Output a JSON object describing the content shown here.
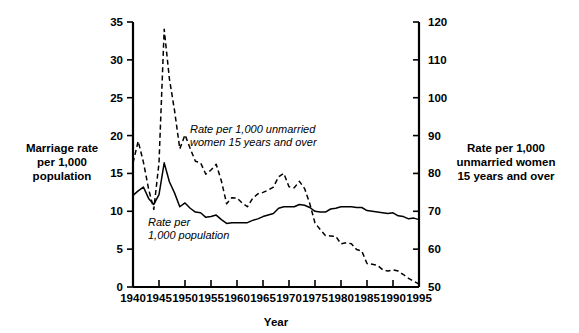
{
  "chart_data": {
    "type": "line",
    "title": "",
    "xlabel": "Year",
    "x": [
      1940,
      1941,
      1942,
      1943,
      1944,
      1945,
      1946,
      1947,
      1948,
      1949,
      1950,
      1951,
      1952,
      1953,
      1954,
      1955,
      1956,
      1957,
      1958,
      1959,
      1960,
      1961,
      1962,
      1963,
      1964,
      1965,
      1966,
      1967,
      1968,
      1969,
      1970,
      1971,
      1972,
      1973,
      1974,
      1975,
      1976,
      1977,
      1978,
      1979,
      1980,
      1981,
      1982,
      1983,
      1984,
      1985,
      1986,
      1987,
      1988,
      1989,
      1990,
      1991,
      1992,
      1993,
      1994,
      1995
    ],
    "xlim": [
      1940,
      1995
    ],
    "xticks": [
      1940,
      1945,
      1950,
      1955,
      1960,
      1965,
      1970,
      1975,
      1980,
      1985,
      1990,
      1995
    ],
    "xticklabels": [
      "1940",
      "1945",
      "1950",
      "1955",
      "1960",
      "1965",
      "1970",
      "1975",
      "1980",
      "1985",
      "1990",
      "1995"
    ],
    "grid": false,
    "legend_position": "inline-annotations",
    "axes": [
      {
        "id": "left",
        "side": "left",
        "label": "Marriage rate\nper 1,000\npopulation",
        "label_lines": [
          "Marriage rate",
          "per 1,000",
          "population"
        ],
        "ylim": [
          0,
          35
        ],
        "yticks": [
          0,
          5,
          10,
          15,
          20,
          25,
          30,
          35
        ],
        "yticklabels": [
          "0",
          "5",
          "10",
          "15",
          "20",
          "25",
          "30",
          "35"
        ]
      },
      {
        "id": "right",
        "side": "right",
        "label": "Rate per 1,000\nunmarried women\n15 years and over",
        "label_lines": [
          "Rate per 1,000",
          "unmarried women",
          "15 years and over"
        ],
        "ylim": [
          50,
          120
        ],
        "yticks": [
          50,
          60,
          70,
          80,
          90,
          100,
          110,
          120
        ],
        "yticklabels": [
          "50",
          "60",
          "70",
          "80",
          "90",
          "100",
          "110",
          "120"
        ]
      }
    ],
    "series": [
      {
        "name": "Rate per 1,000 population",
        "axis": "left",
        "style": "solid",
        "color": "#000000",
        "annotation": "Rate per\n1,000 population",
        "annotation_lines": [
          "Rate per",
          "1,000 population"
        ],
        "values": [
          12.1,
          12.7,
          13.2,
          11.7,
          10.9,
          12.2,
          16.4,
          13.9,
          12.4,
          10.6,
          11.1,
          10.4,
          9.9,
          9.8,
          9.2,
          9.3,
          9.5,
          8.9,
          8.4,
          8.5,
          8.5,
          8.5,
          8.5,
          8.8,
          9.0,
          9.3,
          9.5,
          9.7,
          10.4,
          10.6,
          10.6,
          10.6,
          10.9,
          10.8,
          10.5,
          10.0,
          9.9,
          9.9,
          10.3,
          10.4,
          10.6,
          10.6,
          10.6,
          10.5,
          10.5,
          10.1,
          10.0,
          9.9,
          9.8,
          9.7,
          9.8,
          9.4,
          9.3,
          9.0,
          9.1,
          8.9
        ]
      },
      {
        "name": "Rate per 1,000 unmarried women 15 years and over",
        "axis": "right",
        "style": "dashed",
        "color": "#000000",
        "annotation": "Rate per 1,000 unmarried\nwomen 15 years and over",
        "annotation_lines": [
          "Rate per 1,000 unmarried",
          "women 15 years and over"
        ],
        "values": [
          82.8,
          88.5,
          83.0,
          75.9,
          70.5,
          82.8,
          118.1,
          105.0,
          96.5,
          86.5,
          90.2,
          86.6,
          83.2,
          82.8,
          79.8,
          80.9,
          82.4,
          78.0,
          72.0,
          73.6,
          73.5,
          72.2,
          71.2,
          73.4,
          74.6,
          75.0,
          75.6,
          76.4,
          79.1,
          80.0,
          76.5,
          76.2,
          77.9,
          76.0,
          72.0,
          66.9,
          65.2,
          63.6,
          63.5,
          63.4,
          61.4,
          61.7,
          61.4,
          59.9,
          59.5,
          56.2,
          56.0,
          55.7,
          54.6,
          54.2,
          54.5,
          54.2,
          53.3,
          52.3,
          51.5,
          50.8
        ]
      }
    ]
  }
}
